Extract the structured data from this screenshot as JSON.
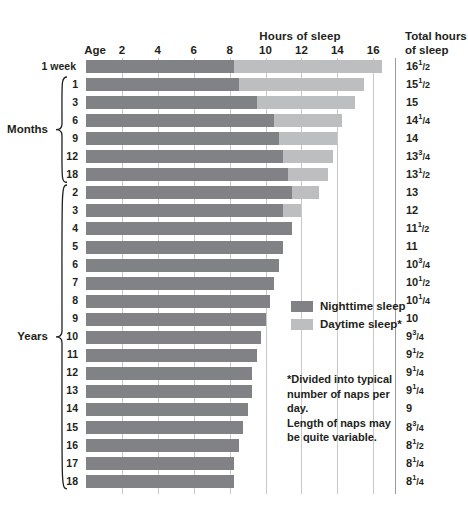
{
  "header": {
    "hours_title": "Hours of sleep",
    "age_title": "Age",
    "total_title_line1": "Total hours",
    "total_title_line2": "of sleep"
  },
  "legend": {
    "nighttime_label": "Nighttime sleep",
    "daytime_label": "Daytime sleep*",
    "nighttime_color": "#808285",
    "daytime_color": "#bcbec0"
  },
  "footnote": {
    "line1": "*Divided into typical",
    "line2": "number of naps per day.",
    "line3": "Length of naps may",
    "line4": "be quite variable."
  },
  "groups": [
    {
      "label": "Months",
      "start_index": 1,
      "end_index": 6
    },
    {
      "label": "Years",
      "start_index": 7,
      "end_index": 23
    }
  ],
  "chart_data": {
    "type": "bar",
    "orientation": "horizontal",
    "stacked": true,
    "title": "Hours of sleep",
    "xlabel": "Hours of sleep",
    "ylabel": "Age",
    "xlim": [
      0,
      18
    ],
    "xticks": [
      2,
      4,
      6,
      8,
      10,
      12,
      14,
      16
    ],
    "xtick_labels": [
      "2",
      "4",
      "6",
      "8",
      "10",
      "12",
      "14",
      "16"
    ],
    "grid": "vertical",
    "legend_position": "center-right",
    "series": [
      {
        "name": "Nighttime sleep",
        "color": "#808285",
        "values": [
          8.25,
          8.5,
          9.5,
          10.5,
          10.75,
          11.0,
          11.25,
          11.5,
          11.0,
          11.5,
          11.0,
          10.75,
          10.5,
          10.25,
          10.0,
          9.75,
          9.5,
          9.25,
          9.25,
          9.0,
          8.75,
          8.5,
          8.25,
          8.25
        ]
      },
      {
        "name": "Daytime sleep*",
        "color": "#bcbec0",
        "values": [
          8.25,
          7.0,
          5.5,
          3.75,
          3.25,
          2.75,
          2.25,
          1.5,
          1.0,
          0,
          0,
          0,
          0,
          0,
          0,
          0,
          0,
          0,
          0,
          0,
          0,
          0,
          0,
          0
        ]
      }
    ],
    "categories": [
      "1 week",
      "1",
      "3",
      "6",
      "9",
      "12",
      "18",
      "2",
      "3",
      "4",
      "5",
      "6",
      "7",
      "8",
      "9",
      "10",
      "11",
      "12",
      "13",
      "14",
      "15",
      "16",
      "17",
      "18"
    ],
    "rows": [
      {
        "age": "1 week",
        "night": 8.25,
        "day": 8.25,
        "total": "16",
        "total_num": "1",
        "total_den": "2"
      },
      {
        "age": "1",
        "night": 8.5,
        "day": 7.0,
        "total": "15",
        "total_num": "1",
        "total_den": "2"
      },
      {
        "age": "3",
        "night": 9.5,
        "day": 5.5,
        "total": "15",
        "total_num": "",
        "total_den": ""
      },
      {
        "age": "6",
        "night": 10.5,
        "day": 3.75,
        "total": "14",
        "total_num": "1",
        "total_den": "4"
      },
      {
        "age": "9",
        "night": 10.75,
        "day": 3.25,
        "total": "14",
        "total_num": "",
        "total_den": ""
      },
      {
        "age": "12",
        "night": 11.0,
        "day": 2.75,
        "total": "13",
        "total_num": "3",
        "total_den": "4"
      },
      {
        "age": "18",
        "night": 11.25,
        "day": 2.25,
        "total": "13",
        "total_num": "1",
        "total_den": "2"
      },
      {
        "age": "2",
        "night": 11.5,
        "day": 1.5,
        "total": "13",
        "total_num": "",
        "total_den": ""
      },
      {
        "age": "3",
        "night": 11.0,
        "day": 1.0,
        "total": "12",
        "total_num": "",
        "total_den": ""
      },
      {
        "age": "4",
        "night": 11.5,
        "day": 0,
        "total": "11",
        "total_num": "1",
        "total_den": "2"
      },
      {
        "age": "5",
        "night": 11.0,
        "day": 0,
        "total": "11",
        "total_num": "",
        "total_den": ""
      },
      {
        "age": "6",
        "night": 10.75,
        "day": 0,
        "total": "10",
        "total_num": "3",
        "total_den": "4"
      },
      {
        "age": "7",
        "night": 10.5,
        "day": 0,
        "total": "10",
        "total_num": "1",
        "total_den": "2"
      },
      {
        "age": "8",
        "night": 10.25,
        "day": 0,
        "total": "10",
        "total_num": "1",
        "total_den": "4"
      },
      {
        "age": "9",
        "night": 10.0,
        "day": 0,
        "total": "10",
        "total_num": "",
        "total_den": ""
      },
      {
        "age": "10",
        "night": 9.75,
        "day": 0,
        "total": "9",
        "total_num": "3",
        "total_den": "4"
      },
      {
        "age": "11",
        "night": 9.5,
        "day": 0,
        "total": "9",
        "total_num": "1",
        "total_den": "2"
      },
      {
        "age": "12",
        "night": 9.25,
        "day": 0,
        "total": "9",
        "total_num": "1",
        "total_den": "4"
      },
      {
        "age": "13",
        "night": 9.25,
        "day": 0,
        "total": "9",
        "total_num": "1",
        "total_den": "4"
      },
      {
        "age": "14",
        "night": 9.0,
        "day": 0,
        "total": "9",
        "total_num": "",
        "total_den": ""
      },
      {
        "age": "15",
        "night": 8.75,
        "day": 0,
        "total": "8",
        "total_num": "3",
        "total_den": "4"
      },
      {
        "age": "16",
        "night": 8.5,
        "day": 0,
        "total": "8",
        "total_num": "1",
        "total_den": "2"
      },
      {
        "age": "17",
        "night": 8.25,
        "day": 0,
        "total": "8",
        "total_num": "1",
        "total_den": "4"
      },
      {
        "age": "18",
        "night": 8.25,
        "day": 0,
        "total": "8",
        "total_num": "1",
        "total_den": "4"
      }
    ]
  }
}
